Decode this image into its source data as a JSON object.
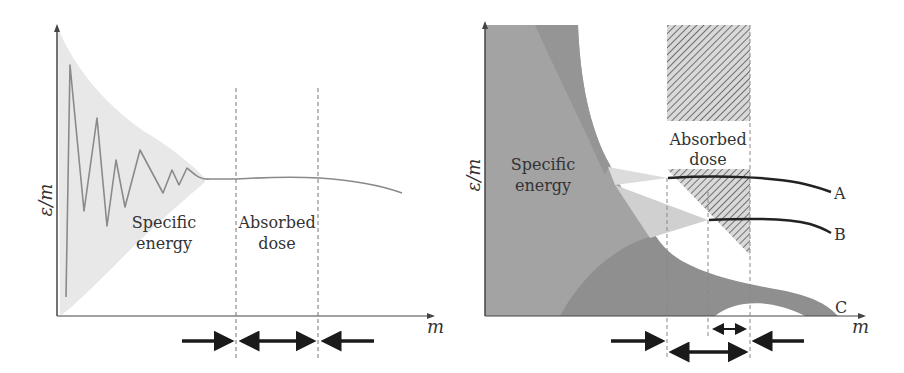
{
  "left_panel": {
    "y_axis_label": "ε/m",
    "x_axis_label": "m",
    "region_labels": {
      "specific_energy_line1": "Specific",
      "specific_energy_line2": "energy",
      "absorbed_dose_line1": "Absorbed",
      "absorbed_dose_line2": "dose"
    }
  },
  "right_panel": {
    "y_axis_label": "ε/m",
    "x_axis_label": "m",
    "region_labels": {
      "specific_energy_line1": "Specific",
      "specific_energy_line2": "energy",
      "absorbed_dose_line1": "Absorbed",
      "absorbed_dose_line2": "dose"
    },
    "curve_labels": [
      "A",
      "B",
      "C"
    ]
  },
  "colors": {
    "axis": "#444444",
    "light_band": "#e6e6e6",
    "curve": "#8a8a8a",
    "dark_fill": "#9a9a9a",
    "darker_fill": "#8c8c8c",
    "hatch": "#777777",
    "arrow": "#1a1a1a",
    "text": "#333333"
  }
}
